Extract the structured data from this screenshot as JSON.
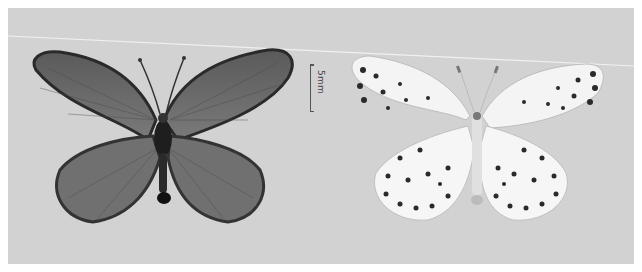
{
  "figure": {
    "scale_bar": {
      "label": "5mm"
    },
    "specimens": [
      {
        "view": "upperside",
        "tone": "dark gray"
      },
      {
        "view": "underside",
        "tone": "whitish with black spots"
      }
    ]
  },
  "colors": {
    "background": "#d2d2d2",
    "border": "#ffffff",
    "upperside_wing": "#6a6a6a",
    "underside_wing": "#f4f4f4",
    "spot": "#222222"
  }
}
